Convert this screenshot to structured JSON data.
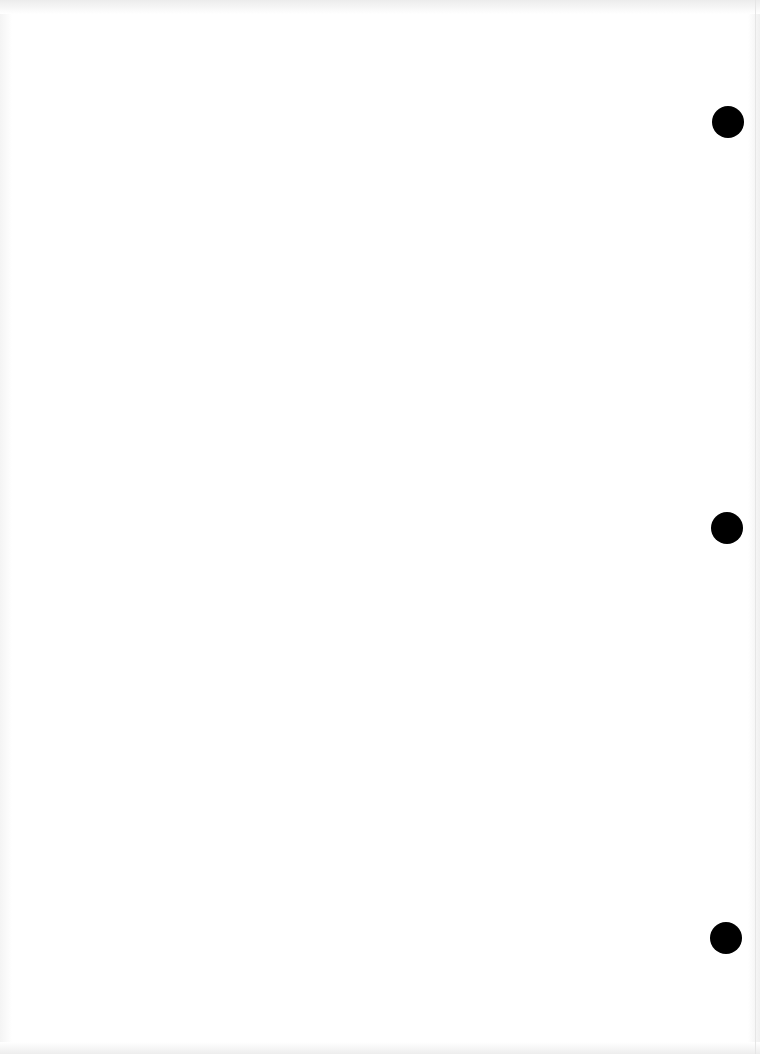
{
  "document": {
    "type": "blank scanned page",
    "punch_holes": [
      {
        "id": "hole-top",
        "cx": 728,
        "cy": 122
      },
      {
        "id": "hole-middle",
        "cx": 727,
        "cy": 528
      },
      {
        "id": "hole-bottom",
        "cx": 726,
        "cy": 938
      }
    ],
    "colors": {
      "paper": "#ffffff",
      "hole": "#000000",
      "edge_shadow": "#ececec"
    }
  }
}
